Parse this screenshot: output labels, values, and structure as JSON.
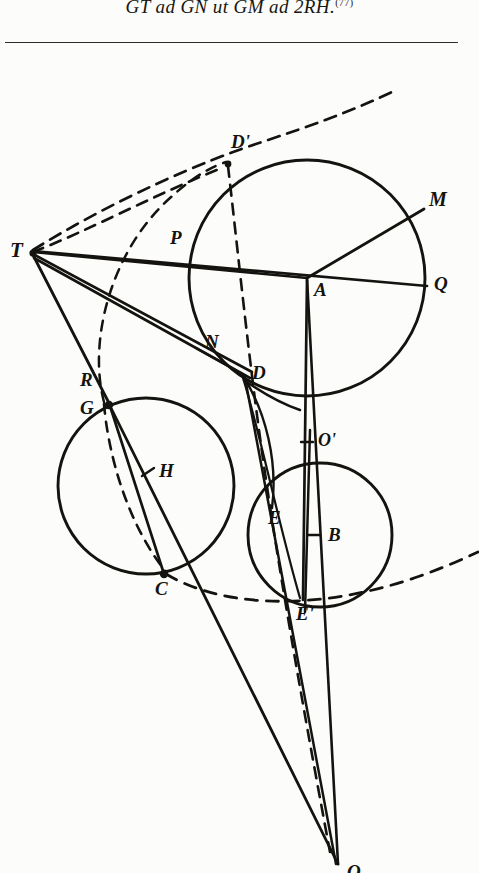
{
  "page": {
    "width": 479,
    "height": 873,
    "background_color": "#fcfcfa",
    "ink_color": "#141310"
  },
  "header": {
    "formula_text": "GT ad GN ut GM ad 2RH.",
    "footnote_marker": "(77)",
    "rule_present": true
  },
  "figure": {
    "caption": "",
    "stroke_color": "#141310",
    "dash_pattern": "9 7",
    "points": [
      {
        "id": "T",
        "label": "T",
        "x": 30,
        "y": 197,
        "label_dx": -22,
        "label_dy": 4,
        "marked": true
      },
      {
        "id": "P",
        "label": "P",
        "x": 182,
        "y": 198,
        "label_dx": -12,
        "label_dy": -6,
        "marked": false
      },
      {
        "id": "Dp",
        "label": "D'",
        "x": 229,
        "y": 110,
        "label_dx": 6,
        "label_dy": -14,
        "marked": true
      },
      {
        "id": "M",
        "label": "M",
        "x": 420,
        "y": 160,
        "label_dx": 11,
        "label_dy": -6,
        "marked": false
      },
      {
        "id": "A",
        "label": "A",
        "x": 307,
        "y": 226,
        "label_dx": 8,
        "label_dy": 18,
        "marked": false
      },
      {
        "id": "Q",
        "label": "Q",
        "x": 424,
        "y": 233,
        "label_dx": 12,
        "label_dy": 5,
        "marked": false
      },
      {
        "id": "N",
        "label": "N",
        "x": 200,
        "y": 300,
        "label_dx": 8,
        "label_dy": -4,
        "marked": false
      },
      {
        "id": "R",
        "label": "R",
        "x": 103,
        "y": 340,
        "label_dx": -20,
        "label_dy": -6,
        "marked": false
      },
      {
        "id": "G",
        "label": "G",
        "x": 108,
        "y": 352,
        "label_dx": -22,
        "label_dy": 10,
        "marked": true
      },
      {
        "id": "D",
        "label": "D",
        "x": 243,
        "y": 324,
        "label_dx": 9,
        "label_dy": 3,
        "marked": false
      },
      {
        "id": "H",
        "label": "H",
        "x": 150,
        "y": 420,
        "label_dx": 11,
        "label_dy": 5,
        "marked": false
      },
      {
        "id": "Op",
        "label": "O'",
        "x": 313,
        "y": 390,
        "label_dx": 9,
        "label_dy": 4,
        "marked": false
      },
      {
        "id": "E",
        "label": "E",
        "x": 272,
        "y": 455,
        "label_dx": 3,
        "label_dy": 17,
        "marked": false
      },
      {
        "id": "B",
        "label": "B",
        "x": 320,
        "y": 483,
        "label_dx": 11,
        "label_dy": 5,
        "marked": false
      },
      {
        "id": "C",
        "label": "C",
        "x": 162,
        "y": 522,
        "label_dx": -4,
        "label_dy": 20,
        "marked": true
      },
      {
        "id": "Ep",
        "label": "E'",
        "x": 300,
        "y": 548,
        "label_dx": 3,
        "label_dy": 19,
        "marked": false
      },
      {
        "id": "O",
        "label": "O",
        "x": 340,
        "y": 815,
        "label_dx": 9,
        "label_dy": 10,
        "marked": false
      }
    ],
    "circles": [
      {
        "name": "large-circle-A",
        "cx": 307,
        "cy": 226,
        "r": 118,
        "style": "solid"
      },
      {
        "name": "left-circle-H",
        "cx": 146,
        "cy": 434,
        "r": 88,
        "style": "solid"
      },
      {
        "name": "right-circle-B",
        "cx": 320,
        "cy": 483,
        "r": 72,
        "style": "solid"
      }
    ],
    "solid_lines": [
      {
        "name": "line-T-Q",
        "from": "T",
        "to": "Q"
      },
      {
        "name": "line-T-A",
        "from": "T",
        "to": "A"
      },
      {
        "name": "line-T-D",
        "from": "T",
        "to": "D"
      },
      {
        "name": "line-T-G",
        "from": "T",
        "to": "G"
      },
      {
        "name": "line-M-A-O",
        "from": "M",
        "to": "O"
      },
      {
        "name": "line-A-Ep",
        "from": "A",
        "to": "Ep"
      },
      {
        "name": "line-G-O",
        "from": "G",
        "to": "O"
      },
      {
        "name": "line-G-C",
        "from": "G",
        "to": "C"
      },
      {
        "name": "line-D-O",
        "from": "D",
        "to": "O"
      },
      {
        "name": "line-N-D",
        "from": "N",
        "to": "D"
      }
    ],
    "dashed_lines": [
      {
        "name": "dash-T-Dp",
        "from": "T",
        "to": "Dp"
      },
      {
        "name": "dash-T-tangent",
        "from": "T",
        "to": "top-tangent"
      },
      {
        "name": "dash-Dp-O",
        "from": "Dp",
        "to": "O"
      },
      {
        "name": "dash-G-C-arc",
        "from": "G",
        "to": "C"
      }
    ],
    "tick_marks": [
      {
        "name": "tick-H",
        "x": 150,
        "y": 420
      },
      {
        "name": "tick-Op",
        "x": 313,
        "y": 390
      },
      {
        "name": "tick-B",
        "x": 320,
        "y": 483
      }
    ],
    "dashed_arc": {
      "name": "outer-dashed-arc",
      "description": "large dashed arc sweeping from upper-left tangent region around the bottom right"
    }
  }
}
